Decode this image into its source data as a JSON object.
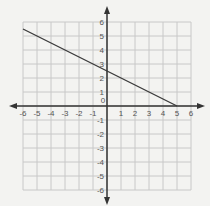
{
  "chart_data": {
    "type": "line",
    "title": "",
    "xlabel": "",
    "ylabel": "",
    "xlim": [
      -6,
      6
    ],
    "ylim": [
      -6,
      6
    ],
    "grid": true,
    "x_ticks": [
      -6,
      -5,
      -4,
      -3,
      -2,
      -1,
      0,
      1,
      2,
      3,
      4,
      5,
      6
    ],
    "y_ticks": [
      -6,
      -5,
      -4,
      -3,
      -2,
      -1,
      1,
      2,
      3,
      4,
      5,
      6
    ],
    "series": [
      {
        "name": "line",
        "equation": "y = -0.5x + 2.5",
        "x": [
          -6,
          5
        ],
        "y": [
          5.5,
          0
        ]
      }
    ],
    "colors": {
      "background": "#f3f3f1",
      "grid": "#c8c8c8",
      "axis": "#333333",
      "line": "#3a3a3a"
    }
  }
}
